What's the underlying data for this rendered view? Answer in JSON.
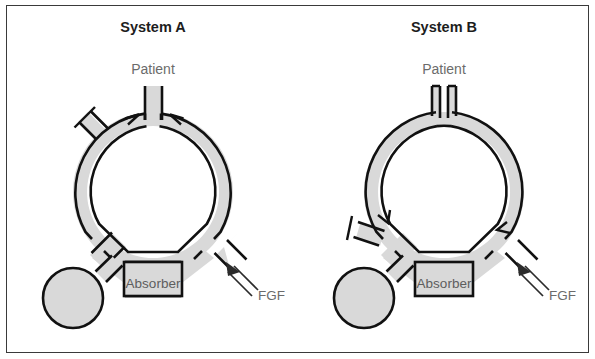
{
  "figure": {
    "kind": "anesthesia-breathing-circuit-diagram",
    "background_color": "#ffffff",
    "border_color": "#3a3a3a",
    "tube_fill_color": "#d9d9d9",
    "tube_stroke_color": "#111111",
    "title_color": "#1d1d1d",
    "label_color": "#6b6b6b"
  },
  "systems": [
    {
      "id": "system-a",
      "title": "System A",
      "patient_label": "Patient",
      "absorber_label": "Absorber",
      "fgf_label": "FGF",
      "circle": {
        "cx": 153,
        "cy": 192,
        "r_outer": 80,
        "r_inner": 66
      },
      "patient_connection": "y-piece",
      "valve_positions": [
        "top-left",
        "top-right"
      ],
      "apl_valve_clock": "10:30",
      "reservoir_bag_clock": "7:30",
      "fgf_inlet_clock": "4:30"
    },
    {
      "id": "system-b",
      "title": "System B",
      "patient_label": "Patient",
      "absorber_label": "Absorber",
      "fgf_label": "FGF",
      "circle": {
        "cx": 444,
        "cy": 192,
        "r_outer": 80,
        "r_inner": 66
      },
      "patient_connection": "two-separate-limbs",
      "valve_positions": [
        "lower-left",
        "lower-right"
      ],
      "apl_valve_clock": "8:00",
      "reservoir_bag_clock": "7:30",
      "fgf_inlet_clock": "4:30"
    }
  ]
}
